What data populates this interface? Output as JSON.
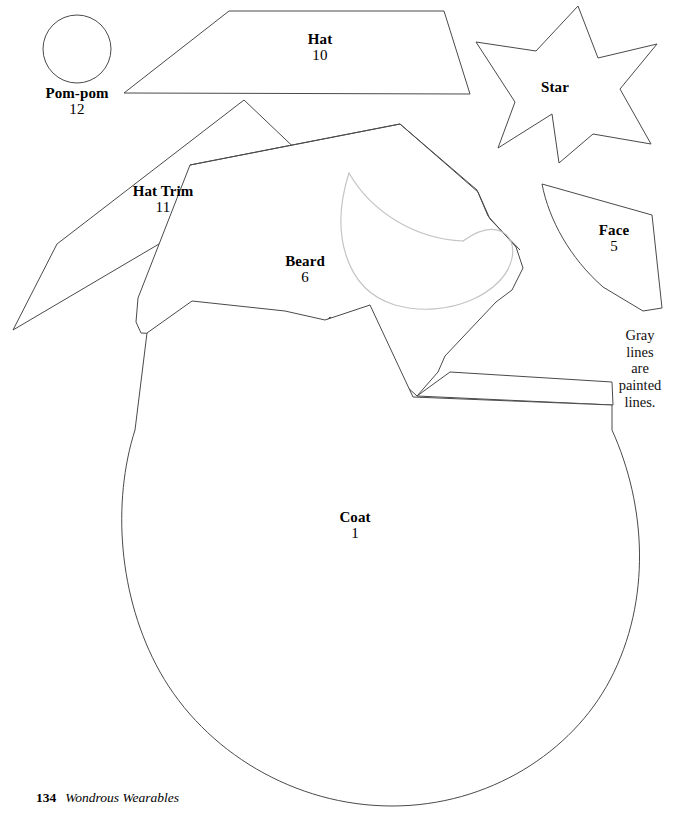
{
  "page": {
    "width": 685,
    "height": 817,
    "background_color": "#ffffff",
    "outline_color": "#4a4a4a",
    "painted_line_color": "#c4c4c4"
  },
  "footer": {
    "page_number": "134",
    "book_title": "Wondrous Wearables"
  },
  "note": {
    "line1": "Gray lines",
    "line2": "are painted",
    "line3": "lines."
  },
  "pieces": [
    {
      "id": "pom-pom",
      "name": "Pom-pom",
      "number": "12",
      "shape": "circle",
      "label_x": 77,
      "label_y": 85
    },
    {
      "id": "hat",
      "name": "Hat",
      "number": "10",
      "shape": "trapezoid",
      "label_x": 320,
      "label_y": 31
    },
    {
      "id": "star",
      "name": "Star",
      "number": "",
      "shape": "five-point-star",
      "label_x": 555,
      "label_y": 79
    },
    {
      "id": "hat-trim",
      "name": "Hat Trim",
      "number": "11",
      "shape": "long-quadrilateral",
      "label_x": 163,
      "label_y": 183
    },
    {
      "id": "face",
      "name": "Face",
      "number": "5",
      "shape": "curved-wedge",
      "label_x": 614,
      "label_y": 222
    },
    {
      "id": "beard",
      "name": "Beard",
      "number": "6",
      "shape": "beard-polygon",
      "label_x": 305,
      "label_y": 253
    },
    {
      "id": "coat",
      "name": "Coat",
      "number": "1",
      "shape": "coat-body",
      "label_x": 355,
      "label_y": 509
    }
  ]
}
